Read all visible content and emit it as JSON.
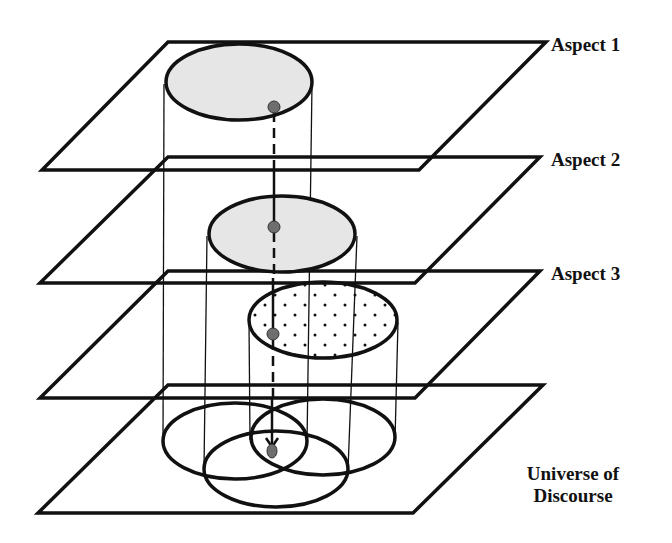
{
  "diagram": {
    "title": "",
    "colors": {
      "line": "#111111",
      "fill_shaded": "#e4e4e4",
      "dot": "#6e6e6e",
      "background": "#ffffff"
    },
    "planes": [
      {
        "id": "aspect-1",
        "label": "Aspect 1"
      },
      {
        "id": "aspect-2",
        "label": "Aspect 2"
      },
      {
        "id": "aspect-3",
        "label": "Aspect 3"
      },
      {
        "id": "universe",
        "label_line1": "Universe of",
        "label_line2": "Discourse"
      }
    ],
    "regions": [
      {
        "plane": "aspect-1",
        "fill": "shaded"
      },
      {
        "plane": "aspect-2",
        "fill": "shaded"
      },
      {
        "plane": "aspect-3",
        "fill": "dotted"
      }
    ],
    "projection": {
      "style": "dashed-to-solid arrow",
      "points": 4,
      "target": "intersection of three regions in Universe of Discourse"
    }
  }
}
